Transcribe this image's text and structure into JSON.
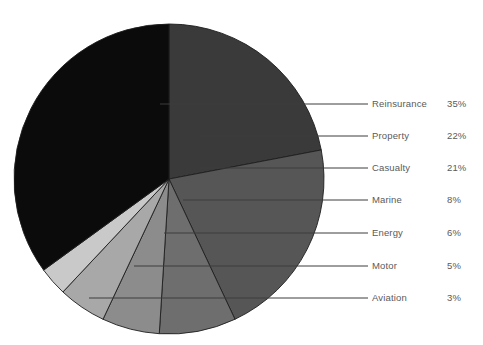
{
  "chart_data": {
    "type": "pie",
    "title": "",
    "subtitle": "",
    "xlabel": "",
    "ylabel": "",
    "legend_position": "right-with-leader-lines",
    "grid": false,
    "categories": [
      "Reinsurance",
      "Property",
      "Casualty",
      "Marine",
      "Energy",
      "Motor",
      "Aviation"
    ],
    "values": [
      35,
      22,
      21,
      8,
      6,
      5,
      3
    ],
    "value_suffix": "%",
    "value_labels": [
      "35%",
      "22%",
      "21%",
      "8%",
      "6%",
      "5%",
      "3%"
    ],
    "slice_colors": [
      "#0b0b0b",
      "#3a3a3a",
      "#565656",
      "#6e6e6e",
      "#8c8c8c",
      "#a8a8a8",
      "#c9c9c9"
    ],
    "total": 100,
    "start_angle_deg": 0,
    "direction": "clockwise"
  },
  "legend": {
    "rows": [
      {
        "label": "Reinsurance",
        "value": "35%",
        "color": "#0b0b0b"
      },
      {
        "label": "Property",
        "value": "22%",
        "color": "#3a3a3a"
      },
      {
        "label": "Casualty",
        "value": "21%",
        "color": "#565656"
      },
      {
        "label": "Marine",
        "value": "8%",
        "color": "#6e6e6e"
      },
      {
        "label": "Energy",
        "value": "6%",
        "color": "#8c8c8c"
      },
      {
        "label": "Motor",
        "value": "5%",
        "color": "#a8a8a8"
      },
      {
        "label": "Aviation",
        "value": "3%",
        "color": "#c9c9c9"
      }
    ]
  },
  "style": {
    "background": "#ffffff",
    "text_color": "#5a5a5a",
    "leader_line_color": "#3c3c3c",
    "slice_edge_color": "#1e1e1e"
  }
}
